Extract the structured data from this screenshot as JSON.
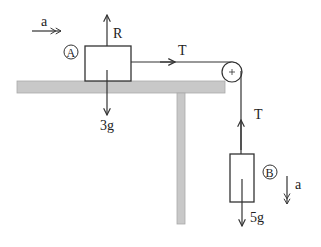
{
  "diagram": {
    "particle_a": {
      "label": "A",
      "weight_label": "3g",
      "reaction_label": "R"
    },
    "particle_b": {
      "label": "B",
      "weight_label": "5g"
    },
    "tension_label_horizontal": "T",
    "tension_label_vertical": "T",
    "acceleration_label_a": "a",
    "acceleration_label_b": "a",
    "colors": {
      "line": "#333333",
      "table": "#c8c8c8",
      "table_edge": "#a8a8a8"
    }
  }
}
